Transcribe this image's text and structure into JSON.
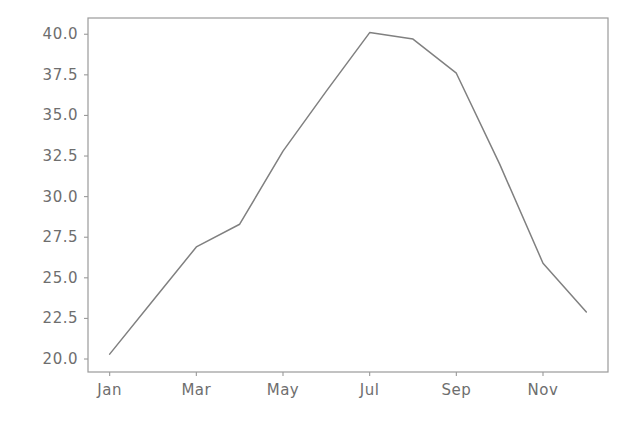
{
  "chart_data": {
    "type": "line",
    "title": "",
    "xlabel": "",
    "ylabel": "",
    "categories": [
      "Jan",
      "Feb",
      "Mar",
      "Apr",
      "May",
      "Jun",
      "Jul",
      "Aug",
      "Sep",
      "Oct",
      "Nov",
      "Dec"
    ],
    "x_tick_labels": [
      "Jan",
      "Mar",
      "May",
      "Jul",
      "Sep",
      "Nov"
    ],
    "y_tick_labels": [
      "20.0",
      "22.5",
      "25.0",
      "27.5",
      "30.0",
      "32.5",
      "35.0",
      "37.5",
      "40.0"
    ],
    "y_ticks": [
      20.0,
      22.5,
      25.0,
      27.5,
      30.0,
      32.5,
      35.0,
      37.5,
      40.0
    ],
    "ylim": [
      19.2,
      41.0
    ],
    "xlim": [
      0.5,
      12.5
    ],
    "grid": false,
    "legend": null,
    "series": [
      {
        "name": "value",
        "color": "#808080",
        "values": [
          20.3,
          23.6,
          26.9,
          28.3,
          32.8,
          36.5,
          40.1,
          39.7,
          37.6,
          32.0,
          25.9,
          22.9
        ]
      }
    ]
  },
  "axes": {
    "spine_color": "#9a9a9a",
    "tick_color": "#9a9a9a",
    "tick_label_color": "#6e6e6e",
    "background": "#ffffff"
  }
}
